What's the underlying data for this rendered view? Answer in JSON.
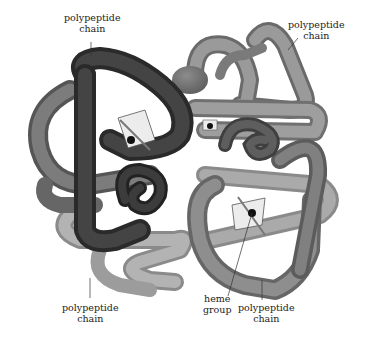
{
  "figure": {
    "labels": {
      "top_left": {
        "line1": "polypeptide",
        "line2": "chain"
      },
      "top_right": {
        "line1": "polypeptide",
        "line2": "chain"
      },
      "bottom_left": {
        "line1": "polypeptide",
        "line2": "chain"
      },
      "bottom_heme": {
        "line1": "heme",
        "line2": "group"
      },
      "bottom_right": {
        "line1": "polypeptide",
        "line2": "chain"
      }
    },
    "colors": {
      "dark_chain": "#3a3a3a",
      "mid_chain": "#6e6e6e",
      "light_chain": "#9a9a9a",
      "lightest_chain": "#b8b8b8",
      "heme_plate": "#e6e6e6",
      "background": "#ffffff"
    }
  }
}
